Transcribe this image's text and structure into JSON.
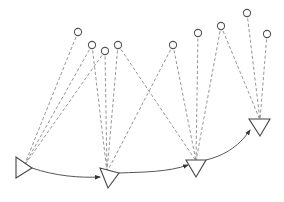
{
  "diagram": {
    "type": "pose-landmark-graph",
    "colors": {
      "landmark_stroke": "#555555",
      "observation_stroke": "#8a8a8a",
      "pose_stroke": "#444444",
      "motion_stroke": "#444444",
      "background": "#ffffff"
    },
    "landmarks": [
      {
        "id": "L1",
        "x": 78,
        "y": 32
      },
      {
        "id": "L2",
        "x": 92,
        "y": 45
      },
      {
        "id": "L3",
        "x": 105,
        "y": 51
      },
      {
        "id": "L4",
        "x": 118,
        "y": 45
      },
      {
        "id": "L5",
        "x": 173,
        "y": 45
      },
      {
        "id": "L6",
        "x": 198,
        "y": 33
      },
      {
        "id": "L7",
        "x": 221,
        "y": 26
      },
      {
        "id": "L8",
        "x": 247,
        "y": 13
      },
      {
        "id": "L9",
        "x": 267,
        "y": 34
      }
    ],
    "poses": [
      {
        "id": "P1",
        "points": "16,157 16,178 32,168",
        "anchor": [
          24,
          166
        ]
      },
      {
        "id": "P2",
        "points": "100,168 108,188 119,173",
        "anchor": [
          107,
          172
        ]
      },
      {
        "id": "P3",
        "points": "186,160 206,160 196,177",
        "anchor": [
          196,
          161
        ]
      },
      {
        "id": "P4",
        "points": "249,119 270,119 260,136",
        "anchor": [
          260,
          120
        ]
      }
    ],
    "observations": [
      {
        "from": "L1",
        "to": "P1"
      },
      {
        "from": "L2",
        "to": "P1"
      },
      {
        "from": "L3",
        "to": "P1"
      },
      {
        "from": "L2",
        "to": "P2"
      },
      {
        "from": "L3",
        "to": "P2"
      },
      {
        "from": "L4",
        "to": "P2"
      },
      {
        "from": "L5",
        "to": "P2"
      },
      {
        "from": "L4",
        "to": "P3"
      },
      {
        "from": "L5",
        "to": "P3"
      },
      {
        "from": "L6",
        "to": "P3"
      },
      {
        "from": "L7",
        "to": "P3"
      },
      {
        "from": "L7",
        "to": "P4"
      },
      {
        "from": "L8",
        "to": "P4"
      },
      {
        "from": "L9",
        "to": "P4"
      }
    ],
    "motions": [
      {
        "from": "P1",
        "to": "P2",
        "path": "M32,168 C55,176 80,178 100,177"
      },
      {
        "from": "P2",
        "to": "P3",
        "path": "M119,173 C145,172 168,172 188,165"
      },
      {
        "from": "P3",
        "to": "P4",
        "path": "M206,160 C222,156 238,148 250,130"
      }
    ]
  }
}
